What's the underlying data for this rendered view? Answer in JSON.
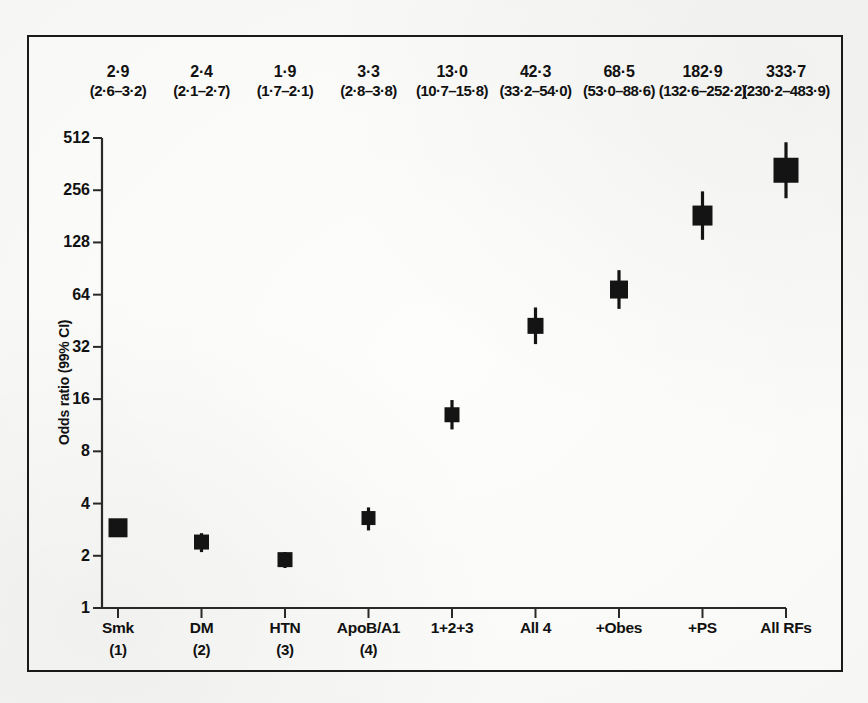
{
  "figure": {
    "background_color": "#fbfbf9",
    "frame_color": "#1a1a1a",
    "marker_color": "#141414"
  },
  "chart_data": {
    "type": "scatter",
    "title": "",
    "subtitle": "",
    "xlabel": "",
    "ylabel": "Odds ratio (99% CI)",
    "yscale": "log2",
    "ylim": [
      1,
      512
    ],
    "yticks": [
      1,
      2,
      4,
      8,
      16,
      32,
      64,
      128,
      256,
      512
    ],
    "ytick_labels": [
      "1",
      "2",
      "4",
      "8",
      "16",
      "32",
      "64",
      "128",
      "256",
      "512"
    ],
    "grid": false,
    "legend": "none",
    "categories": [
      "Smk",
      "DM",
      "HTN",
      "ApoB/A1",
      "1+2+3",
      "All 4",
      "+Obes",
      "+PS",
      "All RFs"
    ],
    "category_sublabels": [
      "(1)",
      "(2)",
      "(3)",
      "(4)",
      "",
      "",
      "",
      "",
      ""
    ],
    "values": [
      2.9,
      2.4,
      1.9,
      3.3,
      13.0,
      42.3,
      68.5,
      182.9,
      333.7
    ],
    "ci_low": [
      2.6,
      2.1,
      1.7,
      2.8,
      10.7,
      33.2,
      53.0,
      132.6,
      230.2
    ],
    "ci_high": [
      3.2,
      2.7,
      2.1,
      3.8,
      15.8,
      54.0,
      88.6,
      252.2,
      483.9
    ],
    "value_labels": [
      "2·9",
      "2·4",
      "1·9",
      "3·3",
      "13·0",
      "42·3",
      "68·5",
      "182·9",
      "333·7"
    ],
    "ci_labels": [
      "(2·6–3·2)",
      "(2·1–2·7)",
      "(1·7–2·1)",
      "(2·8–3·8)",
      "(10·7–15·8)",
      "(33·2–54·0)",
      "(53·0–88·6)",
      "(132·6–252·2)",
      "(230·2–483·9)"
    ],
    "marker_sizes_px": [
      19,
      15,
      15,
      14,
      15,
      16,
      18,
      20,
      25
    ]
  }
}
